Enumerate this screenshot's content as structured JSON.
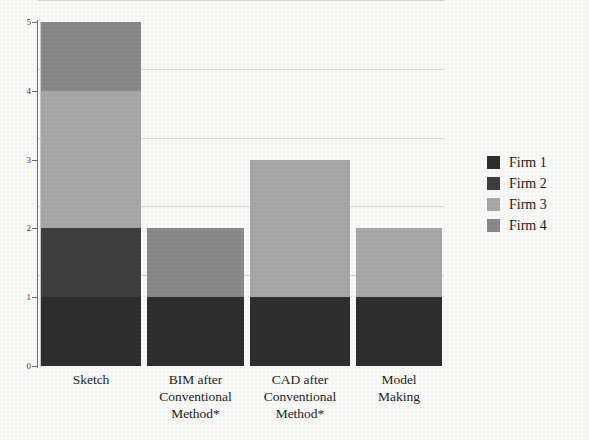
{
  "chart_data": {
    "type": "bar",
    "subtype": "stacked-bar",
    "title": "",
    "xlabel": "",
    "ylabel": "",
    "ylim": [
      0,
      5
    ],
    "ytick_labels": [
      "0",
      "1",
      "2",
      "3",
      "4",
      "5"
    ],
    "grid": true,
    "legend_position": "right",
    "categories": [
      "Sketch",
      "BIM after Conventional Method*",
      "CAD after Conventional Method*",
      "Model Making"
    ],
    "category_lines": [
      [
        "Sketch"
      ],
      [
        "BIM  after",
        "Conventional",
        "Method*"
      ],
      [
        "CAD after",
        "Conventional",
        "Method*"
      ],
      [
        "Model",
        "Making"
      ]
    ],
    "series": [
      {
        "name": "Firm 1",
        "color": "#2f2f2f",
        "values": [
          1,
          1,
          1,
          1
        ]
      },
      {
        "name": "Firm 2",
        "color": "#3f3f3f",
        "values": [
          1,
          0,
          0,
          0
        ]
      },
      {
        "name": "Firm 3",
        "color": "#a9a9a9",
        "values": [
          2,
          0,
          2,
          1
        ]
      },
      {
        "name": "Firm 4",
        "color": "#8a8a8a",
        "values": [
          1,
          1,
          0,
          0
        ]
      }
    ],
    "totals": [
      5,
      2,
      3,
      2
    ]
  },
  "legend": {
    "entries": [
      {
        "label": "Firm 1",
        "color": "#2f2f2f"
      },
      {
        "label": "Firm 2",
        "color": "#3f3f3f"
      },
      {
        "label": "Firm 3",
        "color": "#a9a9a9"
      },
      {
        "label": "Firm 4",
        "color": "#8a8a8a"
      }
    ]
  }
}
